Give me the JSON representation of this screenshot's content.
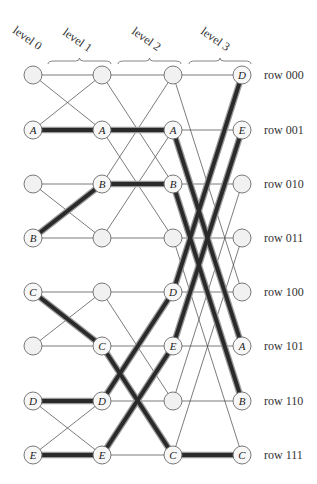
{
  "diagram": {
    "type": "butterfly-network-routing",
    "levels": [
      {
        "label": "level 0",
        "x": 33
      },
      {
        "label": "level 1",
        "x": 102
      },
      {
        "label": "level 2",
        "x": 173
      },
      {
        "label": "level 3",
        "x": 242
      }
    ],
    "rows": [
      {
        "label": "row 000",
        "y": 75
      },
      {
        "label": "row 001",
        "y": 130
      },
      {
        "label": "row 010",
        "y": 184
      },
      {
        "label": "row 011",
        "y": 238
      },
      {
        "label": "row 100",
        "y": 292
      },
      {
        "label": "row 101",
        "y": 346
      },
      {
        "label": "row 110",
        "y": 401
      },
      {
        "label": "row 111",
        "y": 455
      }
    ],
    "braces": [
      {
        "for": "level 1",
        "x1": 48,
        "x2": 111
      },
      {
        "for": "level 2",
        "x1": 118,
        "x2": 181
      },
      {
        "for": "level 3",
        "x1": 189,
        "x2": 251
      }
    ],
    "node_labels": [
      [
        "",
        "A",
        "",
        "B",
        "C",
        "",
        "D",
        "E"
      ],
      [
        "",
        "A",
        "B",
        "",
        "",
        "C",
        "D",
        "E"
      ],
      [
        "",
        "A",
        "B",
        "",
        "D",
        "E",
        "",
        "C"
      ],
      [
        "D",
        "E",
        "",
        "",
        "",
        "A",
        "B",
        "C"
      ]
    ],
    "packets": [
      {
        "name": "A",
        "rows": [
          1,
          1,
          1,
          5
        ]
      },
      {
        "name": "B",
        "rows": [
          3,
          2,
          2,
          6
        ]
      },
      {
        "name": "C",
        "rows": [
          4,
          5,
          7,
          7
        ]
      },
      {
        "name": "D",
        "rows": [
          6,
          6,
          4,
          0
        ]
      },
      {
        "name": "E",
        "rows": [
          7,
          7,
          5,
          1
        ]
      }
    ],
    "colors": {
      "path_core": "#2a2a2a",
      "path_halo": "#9a9a9a",
      "node_fill": "#f1f1f1",
      "node_stroke": "#6a6a6a",
      "thin_edge": "#444444"
    },
    "node_radius": 9
  }
}
